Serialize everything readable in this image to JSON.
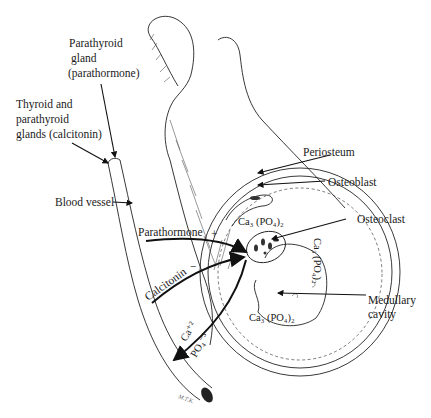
{
  "diagram": {
    "type": "anatomical-illustration",
    "labels": {
      "parathyroid_gland": [
        "Parathyroid",
        "gland",
        "(parathormone)"
      ],
      "thyroid_parathyroid": [
        "Thyroid and",
        "parathyroid",
        "glands (calcitonin)"
      ],
      "blood_vessel": "Blood vessel",
      "parathormone": "Parathormone",
      "parathormone_sign": "+",
      "calcitonin": "Calcitonin",
      "calcitonin_sign": "−",
      "periosteum": "Periosteum",
      "osteoblast": "Osteoblast",
      "osteoclast": "Osteoclast",
      "medullary_cavity": [
        "Medullary",
        "cavity"
      ],
      "calcium_phosphate_top": "Ca₃ (PO₄)₂",
      "calcium_phosphate_right": "Ca₃ (PO₄)₂",
      "calcium_phosphate_bottom": "Ca₃ (PO₄)₂",
      "calcium_ion": "Ca⁺²",
      "phosphate_ion": "PO₄⁻³",
      "signature": "M.T.K."
    }
  }
}
